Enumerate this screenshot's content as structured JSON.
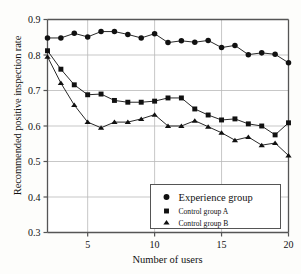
{
  "chart_data": {
    "type": "line",
    "title": "",
    "xlabel": "Number of users",
    "ylabel": "Recommended positive inspection rate",
    "xlim": [
      2,
      20
    ],
    "ylim": [
      0.3,
      0.9
    ],
    "xticks": [
      5,
      10,
      15,
      20
    ],
    "yticks": [
      "0.3",
      "0.4",
      "0.5",
      "0.6",
      "0.7",
      "0.8",
      "0.9"
    ],
    "grid": true,
    "legend_position": "lower-right",
    "x": [
      2,
      3,
      4,
      5,
      6,
      7,
      8,
      9,
      10,
      11,
      12,
      13,
      14,
      15,
      16,
      17,
      18,
      19,
      20
    ],
    "series": [
      {
        "name": "Experience group",
        "marker": "circle",
        "color": "#111111",
        "values": [
          0.848,
          0.848,
          0.861,
          0.851,
          0.866,
          0.866,
          0.858,
          0.848,
          0.86,
          0.835,
          0.84,
          0.836,
          0.841,
          0.821,
          0.827,
          0.801,
          0.806,
          0.802,
          0.778
        ]
      },
      {
        "name": "Control group A",
        "marker": "square",
        "color": "#111111",
        "values": [
          0.812,
          0.76,
          0.716,
          0.688,
          0.69,
          0.672,
          0.667,
          0.667,
          0.67,
          0.679,
          0.679,
          0.648,
          0.631,
          0.617,
          0.62,
          0.606,
          0.6,
          0.575,
          0.609
        ]
      },
      {
        "name": "Control group B",
        "marker": "triangle",
        "color": "#111111",
        "values": [
          0.795,
          0.721,
          0.659,
          0.611,
          0.595,
          0.611,
          0.611,
          0.62,
          0.632,
          0.6,
          0.6,
          0.615,
          0.598,
          0.581,
          0.56,
          0.569,
          0.546,
          0.552,
          0.517
        ]
      }
    ]
  },
  "legend": {
    "items": [
      {
        "label": "Experience group",
        "marker": "circle"
      },
      {
        "label": "Control group A",
        "marker": "square"
      },
      {
        "label": "Control group B",
        "marker": "triangle"
      }
    ]
  }
}
